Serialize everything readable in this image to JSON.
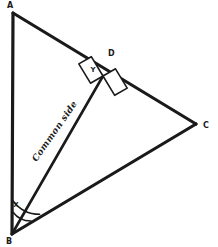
{
  "figure": {
    "background_color": "#ffffff",
    "stroke_color": "#1a1a1a",
    "width": 218,
    "height": 247,
    "vertices": [
      {
        "id": "A",
        "label": "A",
        "x": 13,
        "y": 13,
        "label_x": 10,
        "label_y": 8
      },
      {
        "id": "B",
        "label": "B",
        "x": 12,
        "y": 234,
        "label_x": 9,
        "label_y": 244
      },
      {
        "id": "C",
        "label": "C",
        "x": 196,
        "y": 124,
        "label_x": 203,
        "label_y": 128
      },
      {
        "id": "D",
        "label": "D",
        "x": 103,
        "y": 76,
        "label_x": 108,
        "label_y": 56
      }
    ],
    "segments": [
      {
        "id": "AB",
        "from": "A",
        "to": "B",
        "weight": "thick"
      },
      {
        "id": "AC",
        "from": "A",
        "to": "C",
        "weight": "thick"
      },
      {
        "id": "BC",
        "from": "B",
        "to": "C",
        "weight": "thick"
      },
      {
        "id": "BD",
        "from": "B",
        "to": "D",
        "weight": "med"
      }
    ],
    "angle_marks": [
      {
        "id": "X",
        "label": "X",
        "at": "B",
        "label_x": 16,
        "label_y": 207,
        "kind": "arc"
      },
      {
        "id": "Y",
        "label": "Y",
        "at": "D",
        "label_x": 93,
        "label_y": 72,
        "kind": "right-angle-square"
      }
    ],
    "side_labels": [
      {
        "id": "common-side",
        "text": "Common side",
        "x": 57,
        "y": 133,
        "rotation": -55
      }
    ]
  }
}
